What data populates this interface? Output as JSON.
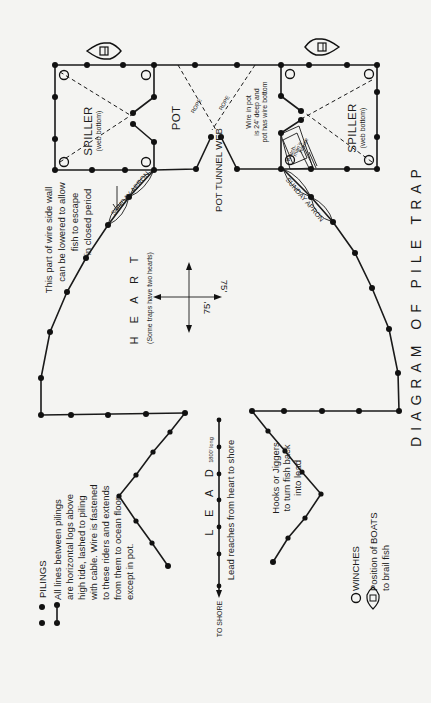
{
  "title": "DIAGRAM OF PILE TRAP",
  "sections": {
    "spiller_left": {
      "label": "SPILLER",
      "sublabel": "(web bottom)"
    },
    "spiller_right": {
      "label": "SPILLER",
      "sublabel": "(web bottom)"
    },
    "pot": {
      "label": "POT"
    },
    "rope_left": {
      "label": "ROPE"
    },
    "rope_right": {
      "label": "ROPE"
    },
    "pot_tunnel": {
      "label": "POT TUNNEL WEB"
    },
    "watchmans_house": {
      "line1": "Watch-",
      "line2": "man's",
      "line3": "house"
    },
    "heart": {
      "label": "H E A R T",
      "note": "(Some traps have two hearts)"
    },
    "lead": {
      "label": "L E A D",
      "length": "1800' long",
      "note": "Lead reaches from heart to shore",
      "to_shore": "TO SHORE"
    },
    "sunday_apron_left": {
      "label": "SUNDAY APRON"
    },
    "sunday_apron_right": {
      "label": "SUNDAY APRON"
    }
  },
  "annotations": {
    "side_wall": [
      "This part of wire side wall",
      "can be lowered to allow",
      "fish to escape",
      "in closed period"
    ],
    "wire_pot": [
      "Wire in pot",
      "is 24' deep and",
      "pot has wire bottom"
    ],
    "hooks": [
      "Hooks or Jiggers",
      "to turn fish back",
      "into lead"
    ]
  },
  "dimensions": {
    "width": "75'",
    "depth": "75'"
  },
  "legend": {
    "pilings": "PILINGS",
    "lines_note": [
      "All lines between pilings",
      "are horizontal logs above",
      "high tide, lashed to piling",
      "with cable. Wire is fastened",
      "to these riders and extends",
      "from them to ocean floor",
      "except in pot."
    ],
    "winches": "WINCHES",
    "boats": [
      "Position of BOATS",
      "to brail fish"
    ]
  },
  "icons": {
    "piling": "filled-circle",
    "winch": "open-circle",
    "boat": "boat-outline"
  },
  "colors": {
    "ink": "#1a1a1a",
    "paper": "#f4f4f2"
  }
}
